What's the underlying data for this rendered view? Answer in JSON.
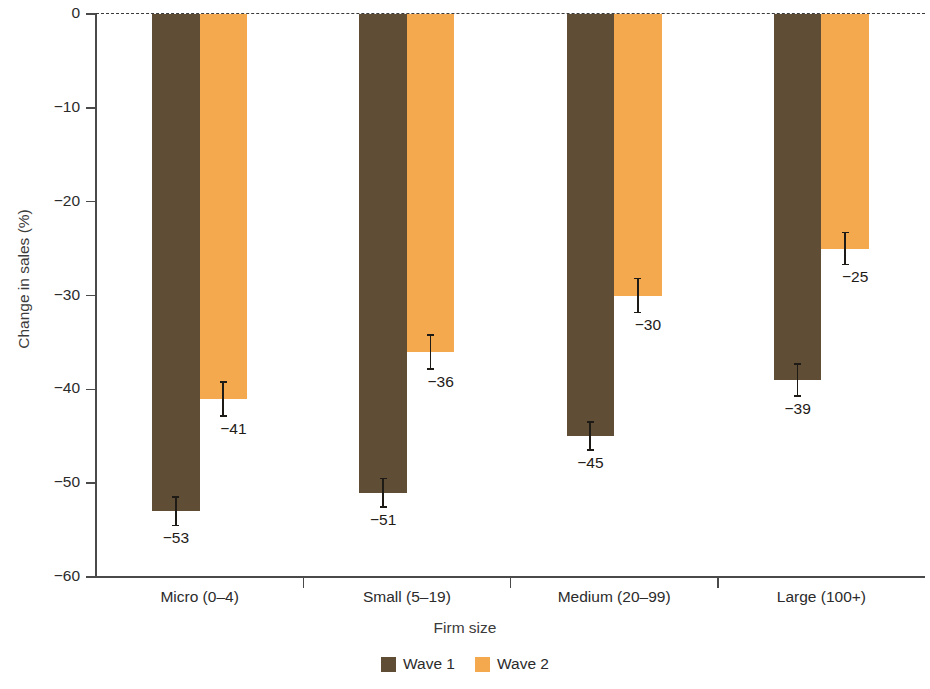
{
  "chart_data": {
    "type": "bar",
    "title": "",
    "xlabel": "Firm size",
    "ylabel": "Change in sales (%)",
    "categories": [
      "Micro (0–4)",
      "Small (5–19)",
      "Medium  (20–99)",
      "Large (100+)"
    ],
    "series": [
      {
        "name": "Wave 1",
        "color": "#5f4e35",
        "values": [
          -53,
          -51,
          -45,
          -39
        ],
        "labels": [
          "−53",
          "−51",
          "−45",
          "−39"
        ],
        "errors": [
          1.6,
          1.6,
          1.6,
          1.8
        ]
      },
      {
        "name": "Wave 2",
        "color": "#f5a94e",
        "values": [
          -41,
          -36,
          -30,
          -25
        ],
        "labels": [
          "−41",
          "−36",
          "−30",
          "−25"
        ],
        "errors": [
          1.9,
          1.9,
          1.9,
          1.8
        ]
      }
    ],
    "ylim": [
      -60,
      0
    ],
    "ytick_values": [
      0,
      -10,
      -20,
      -30,
      -40,
      -50,
      -60
    ],
    "ytick_labels": [
      "0",
      "−10",
      "−20",
      "−30",
      "−40",
      "−50",
      "−60"
    ],
    "grid": false,
    "zero_line": "dashed",
    "legend_position": "bottom-center",
    "legend": [
      "Wave 1",
      "Wave 2"
    ]
  },
  "legend": {
    "items": [
      {
        "label": "Wave 1",
        "color": "#5f4e35"
      },
      {
        "label": "Wave 2",
        "color": "#f5a94e"
      }
    ]
  }
}
